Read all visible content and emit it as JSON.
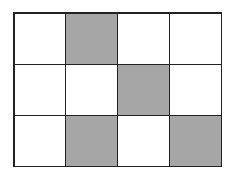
{
  "grid": {
    "rows": 3,
    "cols": 4,
    "shaded_color": "#a6a6a6",
    "empty_color": "#ffffff",
    "line_color": "#222222",
    "cells": [
      [
        0,
        1,
        0,
        0
      ],
      [
        0,
        0,
        1,
        0
      ],
      [
        0,
        1,
        0,
        1
      ]
    ]
  }
}
